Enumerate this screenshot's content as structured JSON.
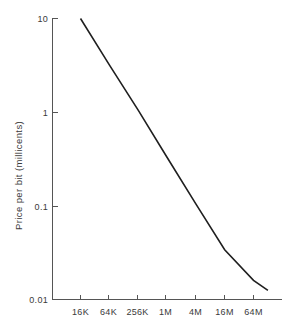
{
  "chart_data": {
    "type": "line",
    "title": "",
    "subtitle": "",
    "xlabel": "",
    "ylabel": "Price per bit (millicents)",
    "xscale": "log",
    "yscale": "log",
    "grid": false,
    "legend": null,
    "legend_position": "none",
    "xtick_labels": [
      "16K",
      "64K",
      "256K",
      "1M",
      "4M",
      "16M",
      "64M"
    ],
    "xtick_values": [
      16384,
      65536,
      262144,
      1048576,
      4194304,
      16777216,
      67108864
    ],
    "ytick_labels": [
      "10",
      "1",
      "0.1",
      "0.01"
    ],
    "ytick_values": [
      10,
      1,
      0.1,
      0.01
    ],
    "ylim": [
      0.01,
      10
    ],
    "xlim": [
      8192,
      134217728
    ],
    "series": [
      {
        "name": "Price per bit",
        "x": [
          16384,
          65536,
          262144,
          1048576,
          4194304,
          16777216,
          67108864,
          134217728
        ],
        "y": [
          10.0,
          3.2,
          1.05,
          0.33,
          0.105,
          0.034,
          0.016,
          0.0125
        ],
        "x_labels": [
          "16K",
          "64K",
          "256K",
          "1M",
          "4M",
          "16M",
          "64M",
          "128M"
        ],
        "color": "#1f1f1f"
      }
    ],
    "annotations": []
  },
  "axes": {
    "y_title": "Price per bit (millicents)",
    "x_title": ""
  }
}
